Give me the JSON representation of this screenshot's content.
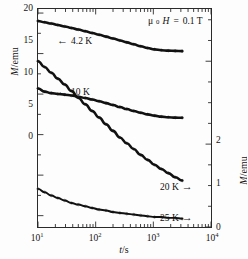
{
  "chart_data": {
    "type": "line",
    "title": "",
    "xlabel": "t/s",
    "ylabel_left": "M/emu",
    "ylabel_right": "M/emu",
    "xscale": "log",
    "xlim": [
      10,
      10000
    ],
    "ylim_left": [
      -6.4,
      20.5
    ],
    "ylim_right": [
      0,
      2.63
    ],
    "grid": false,
    "legend_position": "in-plot-annotations",
    "annotation": "μ0H = 0.1 T",
    "xticks": [
      10,
      100,
      1000,
      10000
    ],
    "xticklabels": [
      "10",
      "10",
      "10",
      "10"
    ],
    "xtickexponents": [
      "1",
      "2",
      "3",
      "4"
    ],
    "yticks_left": [
      0,
      5,
      10,
      15,
      20
    ],
    "yticklabels_left": [
      "0",
      "5",
      "10",
      "15",
      "20"
    ],
    "yticks_right": [
      0,
      1,
      2
    ],
    "yticklabels_right": [
      "0",
      "1",
      "2"
    ],
    "series": [
      {
        "name": "4.2 K",
        "axis": "left",
        "label": "4.2 K",
        "arrow": "left",
        "x": [
          10,
          13,
          17,
          22,
          29,
          38,
          50,
          66,
          87,
          115,
          151,
          200,
          263,
          347,
          457,
          603,
          794,
          1047,
          1380,
          1820,
          2399,
          3162
        ],
        "y": [
          19.02,
          18.86,
          18.7,
          18.53,
          18.35,
          18.16,
          17.96,
          17.76,
          17.54,
          17.32,
          17.09,
          16.86,
          16.62,
          16.38,
          16.14,
          15.9,
          15.68,
          15.52,
          15.42,
          15.36,
          15.33,
          15.3
        ]
      },
      {
        "name": "10 K",
        "axis": "left",
        "label": "10 K",
        "arrow": "left",
        "x": [
          10,
          13,
          17,
          22,
          29,
          38,
          50,
          66,
          87,
          115,
          151,
          200,
          263,
          347,
          457,
          603,
          794,
          1047,
          1380,
          1820,
          2399,
          3162
        ],
        "y": [
          10.7,
          10.3,
          10.12,
          10.02,
          9.93,
          9.82,
          9.68,
          9.52,
          9.33,
          9.12,
          8.89,
          8.65,
          8.4,
          8.15,
          7.92,
          7.7,
          7.5,
          7.34,
          7.22,
          7.14,
          7.1,
          7.08
        ]
      },
      {
        "name": "20 K",
        "axis": "right",
        "label": "20 K",
        "arrow": "right",
        "x": [
          10,
          13,
          17,
          22,
          29,
          38,
          50,
          66,
          87,
          115,
          151,
          200,
          263,
          347,
          457,
          603,
          794,
          1047,
          1380,
          1820,
          2399,
          3162
        ],
        "y": [
          2.0,
          1.93,
          1.86,
          1.79,
          1.72,
          1.64,
          1.56,
          1.48,
          1.4,
          1.32,
          1.24,
          1.16,
          1.08,
          1.01,
          0.94,
          0.87,
          0.81,
          0.75,
          0.7,
          0.65,
          0.6,
          0.56
        ]
      },
      {
        "name": "25 K",
        "axis": "right",
        "label": "25 K",
        "arrow": "right",
        "x": [
          10,
          13,
          17,
          22,
          29,
          38,
          50,
          66,
          87,
          115,
          151,
          200,
          263,
          347,
          457,
          603,
          794,
          1047,
          1380,
          1820,
          2399,
          3162
        ],
        "y": [
          0.46,
          0.42,
          0.38,
          0.35,
          0.32,
          0.29,
          0.27,
          0.25,
          0.23,
          0.21,
          0.2,
          0.18,
          0.17,
          0.16,
          0.15,
          0.14,
          0.13,
          0.12,
          0.12,
          0.11,
          0.11,
          0.1
        ]
      }
    ]
  },
  "axes": {
    "xlabel_numerator": "t",
    "xlabel_denominator": "s",
    "ylabel_numerator": "M",
    "ylabel_denominator": "emu",
    "x_ticklabels": [
      {
        "base": "10",
        "exp": "1"
      },
      {
        "base": "10",
        "exp": "2"
      },
      {
        "base": "10",
        "exp": "3"
      },
      {
        "base": "10",
        "exp": "4"
      }
    ],
    "y_left_ticklabels": [
      "20",
      "15",
      "10",
      "5",
      "0"
    ],
    "y_right_ticklabels": [
      "2",
      "1",
      "0"
    ]
  },
  "annotations": {
    "field": {
      "mu": "μ",
      "sub": "0",
      "h": "H",
      "eq": "=",
      "value": "0.1 T"
    },
    "curve_42": {
      "arrow": "←",
      "label": "4.2 K"
    },
    "curve_10": {
      "arrow": "←",
      "label": "10 K"
    },
    "curve_20": {
      "arrow": "→",
      "label": "20 K"
    },
    "curve_25": {
      "arrow": "→",
      "label": "25 K"
    }
  },
  "style": {
    "line_color": "#111111",
    "marker_color": "#555555",
    "axis_color": "#2a2a2a"
  }
}
